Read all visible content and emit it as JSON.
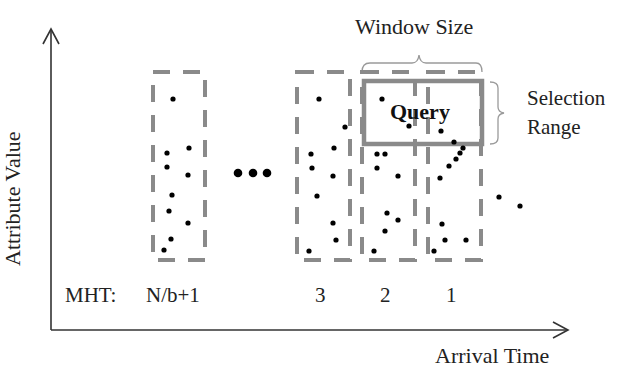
{
  "diagram": {
    "axes": {
      "y_label": "Attribute Value",
      "x_label": "Arrival Time"
    },
    "annotations": {
      "window_size": "Window Size",
      "selection_range_line1": "Selection",
      "selection_range_line2": "Range",
      "query": "Query",
      "ellipsis": "•••"
    },
    "mht": {
      "prefix": "MHT:",
      "labels": [
        "N/b+1",
        "3",
        "2",
        "1"
      ]
    },
    "colors": {
      "axis": "#333333",
      "bucket_border": "#8a8a8a",
      "query_border": "#8a8a8a",
      "bracket": "#9a9a9a",
      "point": "#000000",
      "text": "#222222"
    },
    "buckets": [
      {
        "id": "N/b+1",
        "x": 153,
        "y": 72,
        "w": 52,
        "h": 188
      },
      {
        "id": "3",
        "x": 297,
        "y": 72,
        "w": 53,
        "h": 188
      },
      {
        "id": "2",
        "x": 362,
        "y": 72,
        "w": 53,
        "h": 188
      },
      {
        "id": "1",
        "x": 428,
        "y": 72,
        "w": 53,
        "h": 188
      }
    ],
    "query_box": {
      "x": 364,
      "y": 81,
      "w": 118,
      "h": 63
    },
    "points": [
      [
        173,
        99
      ],
      [
        189,
        148
      ],
      [
        167,
        153
      ],
      [
        167,
        167
      ],
      [
        188,
        175
      ],
      [
        172,
        195
      ],
      [
        169,
        211
      ],
      [
        188,
        223
      ],
      [
        171,
        239
      ],
      [
        164,
        250
      ],
      [
        319,
        99
      ],
      [
        345,
        127
      ],
      [
        334,
        148
      ],
      [
        311,
        154
      ],
      [
        312,
        168
      ],
      [
        333,
        176
      ],
      [
        317,
        196
      ],
      [
        333,
        223
      ],
      [
        336,
        240
      ],
      [
        309,
        251
      ],
      [
        382,
        99
      ],
      [
        409,
        126
      ],
      [
        377,
        154
      ],
      [
        385,
        154
      ],
      [
        377,
        168
      ],
      [
        398,
        176
      ],
      [
        387,
        213
      ],
      [
        398,
        220
      ],
      [
        385,
        231
      ],
      [
        374,
        251
      ],
      [
        441,
        131
      ],
      [
        454,
        142
      ],
      [
        463,
        148
      ],
      [
        460,
        153
      ],
      [
        456,
        159
      ],
      [
        449,
        166
      ],
      [
        440,
        178
      ],
      [
        442,
        224
      ],
      [
        445,
        240
      ],
      [
        466,
        240
      ],
      [
        434,
        251
      ],
      [
        499,
        197
      ],
      [
        520,
        206
      ]
    ]
  }
}
